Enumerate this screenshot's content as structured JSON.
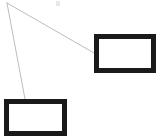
{
  "figure": {
    "title": "",
    "background_color": "#ffffff",
    "width": 158,
    "height": 139
  },
  "style": {
    "frame_border_color": "#1a1a1a",
    "frame_fill_color": "#ffffff",
    "frame_border_width": 5,
    "connector_color": "#b4b4b4",
    "connector_width": 0.9,
    "artifact_color": "#e8e8e8"
  },
  "apex": {
    "name": "viewpoint-vertex",
    "x": 7,
    "y": 3
  },
  "shapes": [
    {
      "id": "frame-top-right",
      "label": "",
      "x": 94,
      "y": 34,
      "width": 62,
      "height": 39
    },
    {
      "id": "frame-bottom-left",
      "label": "",
      "x": 4,
      "y": 99,
      "width": 63,
      "height": 37
    }
  ],
  "connectors": [
    {
      "id": "connector-to-top-right",
      "from_x": 7,
      "from_y": 3,
      "to_x": 94,
      "to_y": 53
    },
    {
      "id": "connector-to-bottom-left",
      "from_x": 7,
      "from_y": 3,
      "to_x": 25,
      "to_y": 99
    }
  ],
  "artifact": {
    "id": "faint-mark",
    "x": 56,
    "y": 1,
    "width": 4,
    "height": 5
  }
}
